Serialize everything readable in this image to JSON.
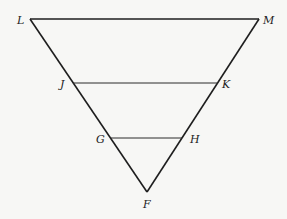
{
  "diagram": {
    "type": "geometry-figure",
    "colors": {
      "background": "#f7f7f5",
      "stroke": "#1e1e1e",
      "label": "#222222"
    },
    "points": {
      "L": {
        "label": "L",
        "x": 30,
        "y": 19
      },
      "M": {
        "label": "M",
        "x": 259,
        "y": 19
      },
      "J": {
        "label": "J",
        "x": 73,
        "y": 83
      },
      "K": {
        "label": "K",
        "x": 218,
        "y": 83
      },
      "G": {
        "label": "G",
        "x": 110,
        "y": 138
      },
      "H": {
        "label": "H",
        "x": 182,
        "y": 138
      },
      "F": {
        "label": "F",
        "x": 147,
        "y": 192
      }
    },
    "segments": [
      {
        "name": "LM",
        "from": "L",
        "to": "M"
      },
      {
        "name": "LF",
        "from": "L",
        "to": "F"
      },
      {
        "name": "MF",
        "from": "M",
        "to": "F"
      },
      {
        "name": "JK",
        "from": "J",
        "to": "K"
      },
      {
        "name": "GH",
        "from": "G",
        "to": "H"
      }
    ],
    "labels": {
      "L": "L",
      "M": "M",
      "J": "J",
      "K": "K",
      "G": "G",
      "H": "H",
      "F": "F"
    }
  }
}
